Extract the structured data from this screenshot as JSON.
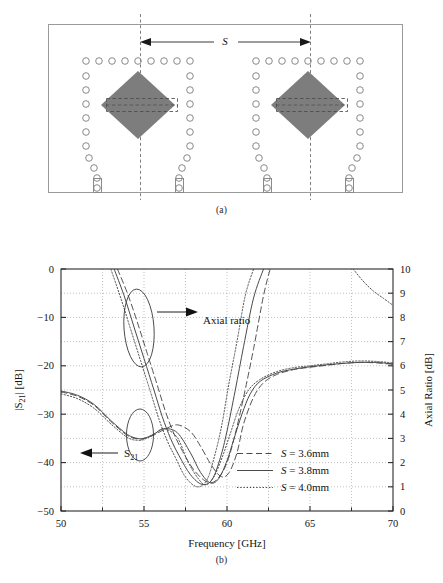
{
  "figure": {
    "panel_a": {
      "caption": "(a)",
      "dimension_label": "S",
      "description": "SIW cavity-backed diamond patch antenna array layout with via holes"
    },
    "panel_b": {
      "caption": "(b)"
    }
  },
  "chart_data": {
    "type": "line",
    "title": "",
    "xlabel": "Frequency [GHz]",
    "ylabel": "|S21| [dB]",
    "ylabel_right": "Axial Ratio [dB]",
    "xlim": [
      50,
      70
    ],
    "ylim": [
      -50,
      0
    ],
    "ylim_right": [
      0,
      10
    ],
    "xticks": [
      50,
      55,
      60,
      65,
      70
    ],
    "xticks_minor": [
      52.5,
      57.5,
      62.5,
      67.5
    ],
    "yticks": [
      0,
      -10,
      -20,
      -30,
      -40,
      -50
    ],
    "yticks_labels": [
      "0",
      "−10",
      "−20",
      "−30",
      "−40",
      "−50"
    ],
    "yticks_right": [
      0,
      1,
      2,
      3,
      4,
      5,
      6,
      7,
      8,
      9,
      10
    ],
    "grid": true,
    "legend_position": "lower-right",
    "annotations": [
      {
        "text": "Axial ratio",
        "x": 58.0,
        "y": -11.5
      },
      {
        "text": "S21",
        "x": 54.0,
        "y": -39.0
      }
    ],
    "legend": [
      {
        "label": "S = 3.6mm",
        "style": "dashed"
      },
      {
        "label": "S = 3.8mm",
        "style": "solid"
      },
      {
        "label": "S = 4.0mm",
        "style": "dotted"
      }
    ],
    "series": [
      {
        "name": "S21, S = 3.6mm",
        "axis": "left",
        "style": "dashed",
        "x": [
          50,
          51,
          52,
          53,
          54,
          54.6,
          55,
          55.6,
          56.2,
          57,
          57.8,
          58.4,
          59,
          59.6,
          60.1,
          60.6,
          61,
          61.6,
          62.2,
          63,
          64,
          65,
          66,
          67,
          68,
          69,
          70
        ],
        "y": [
          -25.4,
          -26.3,
          -28.2,
          -31.5,
          -34.4,
          -35.1,
          -35.0,
          -34.3,
          -33.2,
          -32.2,
          -33.6,
          -36.6,
          -40.2,
          -42.8,
          -42.2,
          -38.0,
          -32.0,
          -26.5,
          -23.5,
          -21.8,
          -20.8,
          -20.3,
          -19.9,
          -19.5,
          -19.3,
          -19.4,
          -19.7
        ]
      },
      {
        "name": "S21, S = 3.8mm",
        "axis": "left",
        "style": "solid",
        "x": [
          50,
          51,
          52,
          53,
          54,
          54.6,
          55,
          55.6,
          56.2,
          57,
          57.8,
          58.4,
          59,
          59.5,
          60,
          60.4,
          60.9,
          61.4,
          62,
          63,
          64,
          65,
          66,
          67,
          68,
          69,
          70
        ],
        "y": [
          -25.2,
          -26.1,
          -28.0,
          -31.3,
          -34.2,
          -35.0,
          -35.0,
          -34.1,
          -33.0,
          -33.8,
          -38.0,
          -42.0,
          -44.2,
          -43.3,
          -39.6,
          -35.3,
          -30.0,
          -25.8,
          -23.2,
          -21.5,
          -20.7,
          -20.2,
          -19.8,
          -19.5,
          -19.3,
          -19.3,
          -19.6
        ]
      },
      {
        "name": "S21, S = 4.0mm",
        "axis": "left",
        "style": "dotted",
        "x": [
          50,
          51,
          52,
          53,
          54,
          54.6,
          55,
          55.6,
          56.2,
          57,
          57.6,
          58.2,
          58.7,
          59.2,
          59.7,
          60.2,
          60.7,
          61.3,
          62,
          63,
          64,
          65,
          66,
          67,
          68,
          69,
          70
        ],
        "y": [
          -25.8,
          -26.8,
          -28.8,
          -32.0,
          -34.8,
          -35.4,
          -35.2,
          -34.2,
          -33.0,
          -34.8,
          -39.5,
          -43.0,
          -44.6,
          -43.0,
          -39.0,
          -34.0,
          -29.0,
          -25.0,
          -22.8,
          -21.2,
          -20.4,
          -20.0,
          -19.6,
          -19.2,
          -19.0,
          -19.1,
          -19.4
        ]
      },
      {
        "name": "Axial ratio, S = 3.6mm",
        "axis": "right",
        "style": "dashed",
        "x": [
          53.4,
          54.0,
          54.6,
          55.2,
          55.8,
          56.3,
          56.8,
          57.3,
          58.0,
          58.8,
          59.4,
          60.0,
          60.5,
          61.0,
          61.6,
          62.2,
          62.6
        ],
        "y": [
          10.0,
          9.0,
          7.8,
          6.5,
          5.2,
          4.1,
          3.2,
          2.5,
          1.7,
          1.2,
          1.3,
          2.0,
          3.2,
          4.7,
          6.7,
          8.9,
          10.0
        ]
      },
      {
        "name": "Axial ratio, S = 3.8mm",
        "axis": "right",
        "style": "solid",
        "x": [
          53.2,
          53.8,
          54.4,
          55.0,
          55.6,
          56.1,
          56.6,
          57.1,
          57.8,
          58.5,
          59.1,
          59.6,
          60.0,
          60.5,
          61.0,
          61.6,
          62.2
        ],
        "y": [
          10.0,
          8.9,
          7.6,
          6.3,
          5.0,
          3.9,
          3.0,
          2.3,
          1.5,
          1.1,
          1.3,
          2.2,
          3.3,
          5.0,
          6.8,
          8.8,
          10.0
        ]
      },
      {
        "name": "Axial ratio, S = 4.0mm",
        "axis": "right",
        "style": "dotted",
        "x": [
          53.0,
          53.6,
          54.2,
          54.8,
          55.4,
          55.9,
          56.4,
          56.9,
          57.5,
          58.2,
          58.8,
          59.3,
          59.7,
          60.1,
          60.6,
          61.1,
          61.6
        ],
        "y": [
          10.0,
          8.8,
          7.5,
          6.2,
          4.9,
          3.8,
          2.9,
          2.2,
          1.4,
          1.0,
          1.3,
          2.4,
          3.6,
          5.2,
          7.0,
          8.9,
          10.0
        ]
      },
      {
        "name": "Axial ratio tail, S = 4.0mm",
        "axis": "right",
        "style": "dotted",
        "x": [
          67.6,
          68.2,
          68.8,
          69.4,
          70.0
        ],
        "y": [
          10.0,
          9.5,
          9.1,
          8.8,
          8.5
        ]
      }
    ]
  },
  "colors": {
    "patch_fill": "#7d7d7d",
    "outline": "#9a9a9a",
    "axis": "#2b2b2b",
    "grid": "#a8a8a8",
    "curve": "#4a4a4a"
  }
}
